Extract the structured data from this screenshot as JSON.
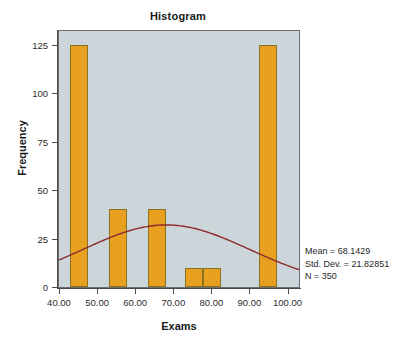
{
  "chart_data": {
    "type": "bar",
    "title": "Histogram",
    "xlabel": "Exams",
    "ylabel": "Frequency",
    "xlim": [
      40,
      103
    ],
    "ylim": [
      0,
      132
    ],
    "grid": false,
    "legend_position": "none",
    "bin_width": 5,
    "x_ticks": [
      "40.00",
      "50.00",
      "60.00",
      "70.00",
      "80.00",
      "90.00",
      "100.00"
    ],
    "x_tick_values": [
      40,
      50,
      60,
      70,
      80,
      90,
      100
    ],
    "y_ticks": [
      "0",
      "25",
      "50",
      "75",
      "100",
      "125"
    ],
    "y_tick_values": [
      0,
      25,
      50,
      75,
      100,
      125
    ],
    "categories": [
      "43-47.5",
      "53-58",
      "63-68",
      "73-77.5",
      "77.5-82",
      "92.5-97"
    ],
    "values": [
      125,
      40,
      40,
      10,
      10,
      125
    ],
    "bars": [
      {
        "x0": 43.0,
        "x1": 47.6,
        "value": 125
      },
      {
        "x0": 53.2,
        "x1": 57.8,
        "value": 40
      },
      {
        "x0": 63.4,
        "x1": 68.0,
        "value": 40
      },
      {
        "x0": 73.2,
        "x1": 77.8,
        "value": 10
      },
      {
        "x0": 77.8,
        "x1": 82.4,
        "value": 10
      },
      {
        "x0": 92.6,
        "x1": 97.2,
        "value": 125
      }
    ],
    "normal_curve": {
      "name": "normal-curve",
      "mean": 68.1429,
      "std_dev": 21.82851,
      "peak_value": 32,
      "color": "#8e2b2b"
    },
    "annotations": {
      "mean": "Mean = 68.1429",
      "std_dev": "Std. Dev. = 21.82851",
      "n": "N = 350"
    },
    "colors": {
      "bar_fill": "#e8a021",
      "bar_edge": "#8a7320",
      "plot_background": "#ccd5da",
      "axis": "#4a4a4a",
      "curve": "#8e2b2b",
      "text": "#1a1a1a",
      "page_background": "#ffffff"
    }
  }
}
